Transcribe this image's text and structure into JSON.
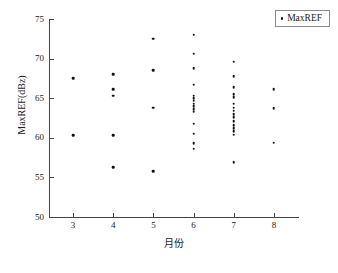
{
  "legend": {
    "entries": [
      {
        "label": "MaxREF",
        "marker": "dot-marker",
        "color": "#111111"
      }
    ],
    "position": "top-right"
  },
  "axes": {
    "x": {
      "label": "月份",
      "ticks": [
        "3",
        "4",
        "5",
        "6",
        "7",
        "8"
      ],
      "range": [
        2.4,
        8.6
      ]
    },
    "y": {
      "label": "MaxREF(dBz)",
      "ticks": [
        "50",
        "55",
        "60",
        "65",
        "70",
        "75"
      ],
      "range": [
        50,
        75
      ]
    }
  },
  "chart_data": {
    "type": "scatter",
    "title": "",
    "xlabel": "月份",
    "ylabel": "MaxREF(dBz)",
    "xlim": [
      2.4,
      8.6
    ],
    "ylim": [
      50,
      75
    ],
    "xticks": [
      3,
      4,
      5,
      6,
      7,
      8
    ],
    "yticks": [
      50,
      55,
      60,
      65,
      70,
      75
    ],
    "grid": false,
    "legend_position": "top-right",
    "series": [
      {
        "name": "MaxREF",
        "color": "#111111",
        "marker": "dot",
        "points": [
          {
            "x": 3,
            "y": 67.5
          },
          {
            "x": 3,
            "y": 60.3
          },
          {
            "x": 4,
            "y": 68.0
          },
          {
            "x": 4,
            "y": 66.1
          },
          {
            "x": 4,
            "y": 65.3
          },
          {
            "x": 4,
            "y": 60.3
          },
          {
            "x": 4,
            "y": 56.3
          },
          {
            "x": 5,
            "y": 72.5
          },
          {
            "x": 5,
            "y": 68.5
          },
          {
            "x": 5,
            "y": 63.8
          },
          {
            "x": 5,
            "y": 55.8
          },
          {
            "x": 6,
            "y": 73.0
          },
          {
            "x": 6,
            "y": 70.6
          },
          {
            "x": 6,
            "y": 68.8
          },
          {
            "x": 6,
            "y": 66.7
          },
          {
            "x": 6,
            "y": 65.3
          },
          {
            "x": 6,
            "y": 65.0
          },
          {
            "x": 6,
            "y": 64.7
          },
          {
            "x": 6,
            "y": 64.3
          },
          {
            "x": 6,
            "y": 64.0
          },
          {
            "x": 6,
            "y": 63.6
          },
          {
            "x": 6,
            "y": 63.3
          },
          {
            "x": 6,
            "y": 61.8
          },
          {
            "x": 6,
            "y": 60.5
          },
          {
            "x": 6,
            "y": 59.3
          },
          {
            "x": 6,
            "y": 58.6
          },
          {
            "x": 7,
            "y": 69.6
          },
          {
            "x": 7,
            "y": 67.8
          },
          {
            "x": 7,
            "y": 66.4
          },
          {
            "x": 7,
            "y": 65.5
          },
          {
            "x": 7,
            "y": 65.1
          },
          {
            "x": 7,
            "y": 64.3
          },
          {
            "x": 7,
            "y": 63.8
          },
          {
            "x": 7,
            "y": 63.4
          },
          {
            "x": 7,
            "y": 63.0
          },
          {
            "x": 7,
            "y": 62.6
          },
          {
            "x": 7,
            "y": 62.1
          },
          {
            "x": 7,
            "y": 61.6
          },
          {
            "x": 7,
            "y": 61.2
          },
          {
            "x": 7,
            "y": 60.8
          },
          {
            "x": 7,
            "y": 60.4
          },
          {
            "x": 7,
            "y": 56.9
          },
          {
            "x": 8,
            "y": 66.1
          },
          {
            "x": 8,
            "y": 63.7
          },
          {
            "x": 8,
            "y": 59.4
          }
        ]
      }
    ]
  }
}
